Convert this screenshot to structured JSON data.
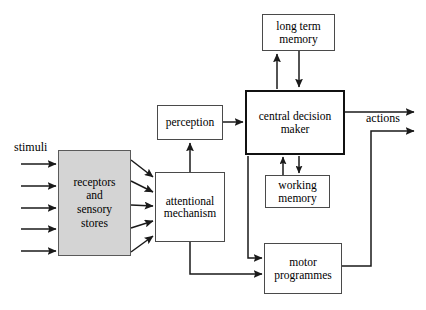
{
  "diagram": {
    "type": "block-flow-diagram",
    "background_color": "#ffffff",
    "line_color": "#1a1a1a",
    "box_fill": "#ffffff",
    "shaded_box_fill": "#d4d4d4",
    "boxes": [
      {
        "id": "receptors",
        "label": "receptors\nand\nsensory\nstores",
        "fill": "#d4d4d4",
        "border": "#5a5a5a",
        "emphasis": "shaded"
      },
      {
        "id": "attentional",
        "label": "attentional\nmechanism",
        "fill": "#ffffff",
        "border": "#4a4a4a",
        "emphasis": "normal"
      },
      {
        "id": "perception",
        "label": "perception",
        "fill": "#ffffff",
        "border": "#4a4a4a",
        "emphasis": "normal"
      },
      {
        "id": "cdm",
        "label": "central decision\nmaker",
        "fill": "#ffffff",
        "border": "#111111",
        "emphasis": "bold"
      },
      {
        "id": "ltm",
        "label": "long term\nmemory",
        "fill": "#ffffff",
        "border": "#4a4a4a",
        "emphasis": "normal"
      },
      {
        "id": "wm",
        "label": "working\nmemory",
        "fill": "#ffffff",
        "border": "#4a4a4a",
        "emphasis": "normal"
      },
      {
        "id": "motor",
        "label": "motor\nprogrammes",
        "fill": "#ffffff",
        "border": "#4a4a4a",
        "emphasis": "normal"
      }
    ],
    "labels": {
      "stimuli": "stimuli",
      "actions": "actions"
    },
    "connections": [
      {
        "from": "stimuli",
        "to": "receptors",
        "count": 5,
        "style": "arrow"
      },
      {
        "from": "receptors",
        "to": "attentional",
        "count": 5,
        "style": "arrow"
      },
      {
        "from": "attentional",
        "to": "perception",
        "count": 1,
        "style": "arrow"
      },
      {
        "from": "perception",
        "to": "cdm",
        "count": 1,
        "style": "arrow"
      },
      {
        "from": "cdm",
        "to": "ltm",
        "count": 1,
        "style": "arrow"
      },
      {
        "from": "ltm",
        "to": "cdm",
        "count": 1,
        "style": "arrow"
      },
      {
        "from": "cdm",
        "to": "wm",
        "count": 1,
        "style": "arrow"
      },
      {
        "from": "wm",
        "to": "cdm",
        "count": 1,
        "style": "arrow"
      },
      {
        "from": "cdm",
        "to": "motor",
        "count": 1,
        "style": "elbow-arrow"
      },
      {
        "from": "attentional",
        "to": "motor",
        "count": 1,
        "style": "elbow-arrow"
      },
      {
        "from": "cdm",
        "to": "actions",
        "count": 1,
        "style": "arrow"
      },
      {
        "from": "motor",
        "to": "actions",
        "count": 1,
        "style": "elbow-arrow"
      }
    ]
  }
}
